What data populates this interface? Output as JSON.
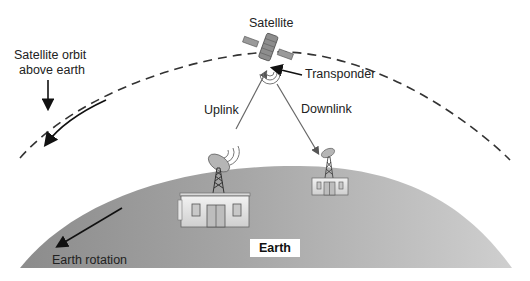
{
  "diagram": {
    "type": "satellite-communication",
    "labels": {
      "satellite": "Satellite",
      "orbit_line1": "Satellite orbit",
      "orbit_line2": "above earth",
      "transponder": "Transponder",
      "uplink": "Uplink",
      "downlink": "Downlink",
      "earth": "Earth",
      "earth_rotation": "Earth rotation"
    },
    "nodes": [
      {
        "id": "satellite",
        "label": "Satellite"
      },
      {
        "id": "transponder",
        "label": "Transponder"
      },
      {
        "id": "ground-station-uplink",
        "label": ""
      },
      {
        "id": "ground-station-downlink",
        "label": ""
      },
      {
        "id": "earth",
        "label": "Earth"
      }
    ],
    "edges": [
      {
        "from": "ground-station-uplink",
        "to": "satellite",
        "label": "Uplink"
      },
      {
        "from": "satellite",
        "to": "ground-station-downlink",
        "label": "Downlink"
      }
    ],
    "colors": {
      "earth_fill_dark": "#8a8a8a",
      "earth_fill_light": "#c4c4c4",
      "orbit_dash": "#333333",
      "link_line": "#6a6a6a",
      "background": "#ffffff"
    }
  }
}
